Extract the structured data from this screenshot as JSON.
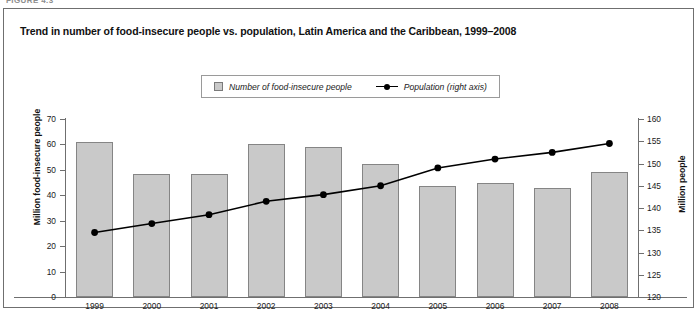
{
  "figure_label": "FIGURE 4.3",
  "title": "Trend in number of food-insecure people vs. population, Latin America and the Caribbean, 1999–2008",
  "legend": {
    "bars_label": "Number of food-insecure people",
    "line_label": "Population (right axis)",
    "bar_swatch_color": "#c9c9c9",
    "line_color": "#000000"
  },
  "chart_data": {
    "type": "bar",
    "title": "Trend in number of food-insecure people vs. population, Latin America and the Caribbean, 1999–2008",
    "xlabel": "",
    "categories": [
      "1999",
      "2000",
      "2001",
      "2002",
      "2003",
      "2004",
      "2005",
      "2006",
      "2007",
      "2008"
    ],
    "series": [
      {
        "name": "Number of food-insecure people",
        "type": "bar",
        "axis": "left",
        "unit": "Million people",
        "color": "#c9c9c9",
        "values": [
          61,
          48.5,
          48.5,
          60,
          59,
          52.5,
          43.5,
          45,
          43,
          49
        ]
      },
      {
        "name": "Population (right axis)",
        "type": "line",
        "axis": "right",
        "unit": "Million people",
        "color": "#000000",
        "values": [
          134.5,
          136.5,
          138.5,
          141.5,
          143,
          145,
          149,
          151,
          152.5,
          154.5
        ]
      }
    ],
    "yaxis_left": {
      "label": "Million food-insecure people",
      "ylim": [
        0,
        70
      ],
      "ticks": [
        0,
        10,
        20,
        30,
        40,
        50,
        60,
        70
      ]
    },
    "yaxis_right": {
      "label": "Million people",
      "ylim": [
        120,
        160
      ],
      "ticks": [
        120,
        125,
        130,
        135,
        140,
        145,
        150,
        155,
        160
      ]
    },
    "grid": false,
    "legend_position": "top-center"
  }
}
